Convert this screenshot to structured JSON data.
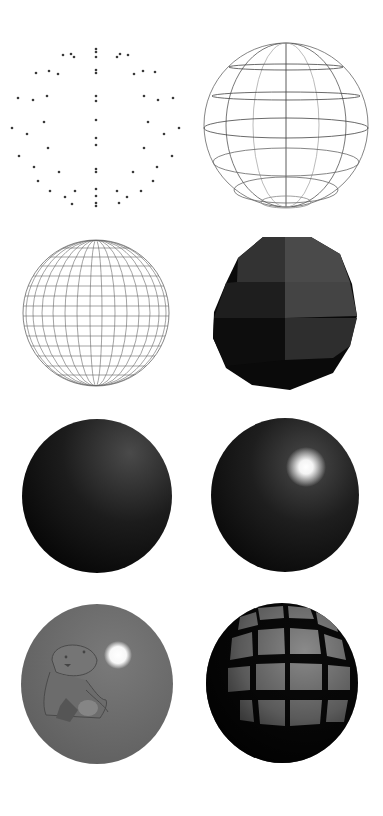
{
  "figure": {
    "panels": [
      {
        "id": "point-cloud",
        "label": "",
        "style": "vertices only"
      },
      {
        "id": "wireframe-sparse",
        "label": "",
        "style": "sparse wireframe"
      },
      {
        "id": "wireframe-dense",
        "label": "",
        "style": "dense lat/long wireframe"
      },
      {
        "id": "flat-shaded",
        "label": "",
        "style": "faceted flat shading"
      },
      {
        "id": "smooth-shaded",
        "label": "",
        "style": "smooth diffuse shading"
      },
      {
        "id": "specular-shaded",
        "label": "",
        "style": "smooth shading with specular highlight"
      },
      {
        "id": "image-textured",
        "label": "",
        "style": "image texture (cat) with highlight"
      },
      {
        "id": "grid-textured",
        "label": "",
        "style": "checker grid texture"
      }
    ]
  },
  "colors": {
    "background": "#ffffff",
    "point": "#3a3a3a",
    "wire": "#555555",
    "wire_light": "#9a9a9a",
    "sphere_dark": "#0a0a0a",
    "sphere_mid": "#3c3c3c",
    "highlight": "#ffffff",
    "texture_gray": "#6e6e6e"
  }
}
